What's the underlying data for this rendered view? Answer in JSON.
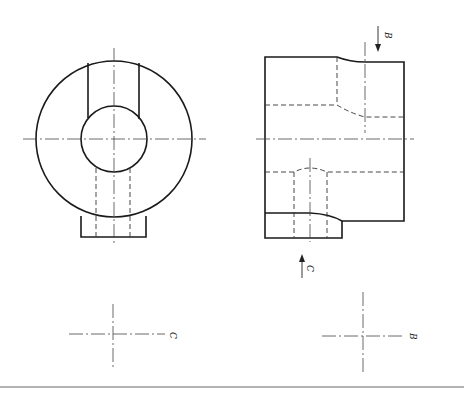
{
  "drawing": {
    "type": "orthographic technical drawing",
    "views": [
      {
        "name": "front-view",
        "description": "circular view with through hole, top slot and bottom tab"
      },
      {
        "name": "side-view",
        "description": "rectangular side view with hidden lines"
      }
    ],
    "section_labels": {
      "arrow_b": "B",
      "arrow_c": "C",
      "cross_c_label": "C",
      "cross_b_label": "B"
    },
    "colors": {
      "line": "#1a1a1a",
      "background": "#ffffff"
    }
  }
}
